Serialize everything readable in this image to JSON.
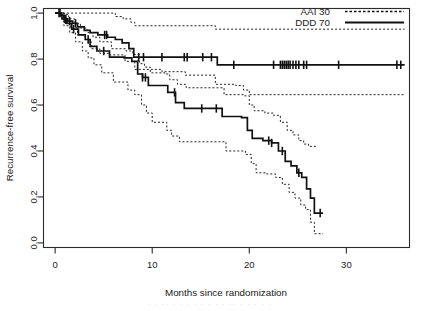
{
  "figure": {
    "background_color": "#ffffff",
    "frame_color": "#2b2b2b",
    "curve_color": "#111111"
  },
  "legend": {
    "position": "top-right",
    "entries": [
      {
        "label": "AAI 30",
        "style": "dashed"
      },
      {
        "label": "DDD 70",
        "style": "solid"
      }
    ]
  },
  "footer": {
    "artifact_text": "·  ·   ··  ·  ·    ·  ·   ·     ·  ·  ·   ··  ·     ·    ·  ·  ·"
  },
  "chart_data": {
    "type": "line",
    "subtype": "kaplan-meier-survival",
    "title": "",
    "xlabel": "Months since randomization",
    "ylabel": "Recurrence-free survival",
    "xlim": [
      -1.2,
      36.5
    ],
    "ylim": [
      -0.02,
      1.02
    ],
    "xticks": [
      0,
      10,
      20,
      30
    ],
    "xtick_labels": [
      "0",
      "10",
      "20",
      "30"
    ],
    "yticks": [
      0.0,
      0.2,
      0.4,
      0.6,
      0.8,
      1.0
    ],
    "ytick_labels": [
      "0.0",
      "0.2",
      "0.4",
      "0.6",
      "0.8",
      "1.0"
    ],
    "grid": false,
    "legend_position": "top-right",
    "series": [
      {
        "name": "AAI 30",
        "line_style": "solid",
        "comment": "upper curve, plateaus near 0.775",
        "steps": [
          [
            0.0,
            1.0
          ],
          [
            0.6,
            0.99
          ],
          [
            0.9,
            0.975
          ],
          [
            1.3,
            0.965
          ],
          [
            1.8,
            0.955
          ],
          [
            2.3,
            0.94
          ],
          [
            3.0,
            0.925
          ],
          [
            3.6,
            0.915
          ],
          [
            4.4,
            0.905
          ],
          [
            5.4,
            0.895
          ],
          [
            6.2,
            0.885
          ],
          [
            6.9,
            0.87
          ],
          [
            7.6,
            0.845
          ],
          [
            8.1,
            0.808
          ],
          [
            11.0,
            0.808
          ],
          [
            13.3,
            0.808
          ],
          [
            16.4,
            0.808
          ],
          [
            16.7,
            0.775
          ],
          [
            36.0,
            0.775
          ]
        ],
        "censor_times": [
          0.4,
          1.0,
          1.5,
          2.1,
          5.1,
          5.3,
          8.6,
          9.1,
          11.0,
          13.3,
          13.6,
          15.2,
          16.1,
          18.4,
          22.5,
          23.2,
          23.4,
          23.6,
          23.8,
          24.0,
          24.2,
          24.5,
          24.8,
          25.1,
          25.6,
          25.9,
          29.2,
          35.2,
          35.6
        ],
        "ci_upper": [
          [
            0.0,
            1.0
          ],
          [
            1.0,
            1.0
          ],
          [
            2.2,
            1.0
          ],
          [
            4.0,
            1.0
          ],
          [
            5.6,
            1.0
          ],
          [
            6.2,
            0.985
          ],
          [
            7.0,
            0.975
          ],
          [
            7.8,
            0.96
          ],
          [
            8.2,
            0.945
          ],
          [
            13.4,
            0.945
          ],
          [
            16.5,
            0.93
          ],
          [
            36.0,
            0.93
          ]
        ],
        "ci_lower": [
          [
            0.0,
            1.0
          ],
          [
            0.9,
            0.955
          ],
          [
            1.6,
            0.935
          ],
          [
            2.3,
            0.905
          ],
          [
            3.1,
            0.885
          ],
          [
            3.7,
            0.845
          ],
          [
            4.6,
            0.825
          ],
          [
            5.6,
            0.818
          ],
          [
            7.2,
            0.79
          ],
          [
            8.2,
            0.755
          ],
          [
            11.0,
            0.745
          ],
          [
            13.4,
            0.73
          ],
          [
            16.5,
            0.69
          ],
          [
            18.6,
            0.685
          ],
          [
            19.4,
            0.665
          ],
          [
            20.0,
            0.645
          ],
          [
            36.0,
            0.645
          ]
        ]
      },
      {
        "name": "DDD 70",
        "line_style": "solid",
        "comment": "lower curve, declines to about 0.13 at 27 months",
        "steps": [
          [
            0.0,
            1.0
          ],
          [
            0.7,
            0.975
          ],
          [
            1.2,
            0.955
          ],
          [
            1.7,
            0.93
          ],
          [
            2.4,
            0.905
          ],
          [
            3.1,
            0.885
          ],
          [
            3.6,
            0.855
          ],
          [
            4.3,
            0.835
          ],
          [
            5.6,
            0.808
          ],
          [
            7.1,
            0.805
          ],
          [
            7.9,
            0.79
          ],
          [
            8.5,
            0.735
          ],
          [
            9.0,
            0.72
          ],
          [
            9.6,
            0.685
          ],
          [
            11.1,
            0.685
          ],
          [
            11.6,
            0.655
          ],
          [
            12.4,
            0.61
          ],
          [
            13.3,
            0.585
          ],
          [
            16.5,
            0.585
          ],
          [
            17.2,
            0.55
          ],
          [
            19.2,
            0.545
          ],
          [
            19.8,
            0.49
          ],
          [
            20.3,
            0.455
          ],
          [
            21.4,
            0.445
          ],
          [
            22.3,
            0.435
          ],
          [
            23.0,
            0.4
          ],
          [
            23.7,
            0.355
          ],
          [
            24.3,
            0.335
          ],
          [
            24.9,
            0.305
          ],
          [
            25.4,
            0.285
          ],
          [
            25.9,
            0.235
          ],
          [
            26.3,
            0.195
          ],
          [
            26.7,
            0.13
          ],
          [
            27.6,
            0.13
          ]
        ],
        "censor_times": [
          0.5,
          1.1,
          1.9,
          3.4,
          5.0,
          9.0,
          9.3,
          12.3,
          15.1,
          16.6,
          22.0,
          22.3,
          23.4,
          25.1,
          27.3
        ],
        "ci_upper": [
          [
            0.0,
            1.0
          ],
          [
            0.9,
            0.995
          ],
          [
            1.4,
            0.975
          ],
          [
            2.0,
            0.955
          ],
          [
            2.6,
            0.935
          ],
          [
            3.3,
            0.915
          ],
          [
            3.9,
            0.895
          ],
          [
            4.6,
            0.875
          ],
          [
            5.8,
            0.845
          ],
          [
            7.3,
            0.835
          ],
          [
            8.0,
            0.82
          ],
          [
            8.7,
            0.78
          ],
          [
            9.2,
            0.765
          ],
          [
            9.8,
            0.74
          ],
          [
            11.3,
            0.735
          ],
          [
            11.8,
            0.71
          ],
          [
            12.6,
            0.69
          ],
          [
            13.5,
            0.675
          ],
          [
            16.7,
            0.675
          ],
          [
            17.4,
            0.645
          ],
          [
            19.4,
            0.64
          ],
          [
            20.0,
            0.6
          ],
          [
            20.5,
            0.575
          ],
          [
            21.6,
            0.565
          ],
          [
            22.5,
            0.555
          ],
          [
            23.2,
            0.525
          ],
          [
            23.9,
            0.49
          ],
          [
            24.5,
            0.47
          ],
          [
            25.1,
            0.445
          ],
          [
            25.6,
            0.43
          ],
          [
            26.1,
            0.42
          ],
          [
            26.9,
            0.42
          ]
        ],
        "ci_lower": [
          [
            0.0,
            1.0
          ],
          [
            0.9,
            0.945
          ],
          [
            1.5,
            0.915
          ],
          [
            2.1,
            0.875
          ],
          [
            2.8,
            0.835
          ],
          [
            3.4,
            0.805
          ],
          [
            4.0,
            0.775
          ],
          [
            4.8,
            0.74
          ],
          [
            6.0,
            0.7
          ],
          [
            7.5,
            0.665
          ],
          [
            8.2,
            0.645
          ],
          [
            8.9,
            0.6
          ],
          [
            9.4,
            0.565
          ],
          [
            10.0,
            0.525
          ],
          [
            11.5,
            0.49
          ],
          [
            12.0,
            0.465
          ],
          [
            12.8,
            0.44
          ],
          [
            13.7,
            0.44
          ],
          [
            16.9,
            0.44
          ],
          [
            17.6,
            0.4
          ],
          [
            19.6,
            0.385
          ],
          [
            20.2,
            0.345
          ],
          [
            20.7,
            0.305
          ],
          [
            21.8,
            0.3
          ],
          [
            22.7,
            0.285
          ],
          [
            23.4,
            0.255
          ],
          [
            24.1,
            0.22
          ],
          [
            24.7,
            0.195
          ],
          [
            25.3,
            0.165
          ],
          [
            25.8,
            0.145
          ],
          [
            26.3,
            0.09
          ],
          [
            26.7,
            0.04
          ],
          [
            27.6,
            0.04
          ]
        ]
      }
    ]
  }
}
